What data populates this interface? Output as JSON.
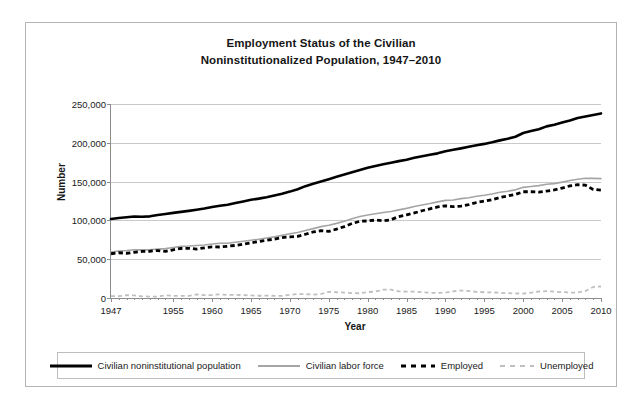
{
  "chart_data": {
    "type": "line",
    "title": "Employment Status of the Civilian Noninstitutionalized Population, 1947–2010",
    "title_line1": "Employment Status of the Civilian",
    "title_line2": "Noninstitutionalized Population, 1947–2010",
    "xlabel": "Year",
    "ylabel": "Number",
    "xlim": [
      1947,
      2010
    ],
    "ylim": [
      0,
      250000
    ],
    "grid": "horizontal",
    "legend_position": "bottom",
    "ytick_labels": [
      "0",
      "50,000",
      "100,000",
      "150,000",
      "200,000",
      "250,000"
    ],
    "ytick_values": [
      0,
      50000,
      100000,
      150000,
      200000,
      250000
    ],
    "xtick_labels": [
      "1947",
      "1955",
      "1960",
      "1965",
      "1970",
      "1975",
      "1980",
      "1985",
      "1990",
      "1995",
      "2000",
      "2005",
      "2010"
    ],
    "xtick_values": [
      1947,
      1955,
      1960,
      1965,
      1970,
      1975,
      1980,
      1985,
      1990,
      1995,
      2000,
      2005,
      2010
    ],
    "x": [
      1947,
      1948,
      1949,
      1950,
      1951,
      1952,
      1953,
      1954,
      1955,
      1956,
      1957,
      1958,
      1959,
      1960,
      1961,
      1962,
      1963,
      1964,
      1965,
      1966,
      1967,
      1968,
      1969,
      1970,
      1971,
      1972,
      1973,
      1974,
      1975,
      1976,
      1977,
      1978,
      1979,
      1980,
      1981,
      1982,
      1983,
      1984,
      1985,
      1986,
      1987,
      1988,
      1989,
      1990,
      1991,
      1992,
      1993,
      1994,
      1995,
      1996,
      1997,
      1998,
      1999,
      2000,
      2001,
      2002,
      2003,
      2004,
      2005,
      2006,
      2007,
      2008,
      2009,
      2010
    ],
    "series": [
      {
        "name": "Civilian noninstitutional population",
        "style": "solid-thick-black",
        "color": "#000000",
        "values": [
          101827,
          103068,
          103994,
          104995,
          104621,
          105231,
          107056,
          108321,
          109683,
          110954,
          112265,
          113727,
          115329,
          117245,
          118771,
          120153,
          122416,
          124485,
          126513,
          128058,
          129874,
          132028,
          134335,
          137085,
          140216,
          144126,
          147096,
          150120,
          153153,
          156150,
          159033,
          161910,
          164863,
          167745,
          170130,
          172271,
          174215,
          176383,
          178206,
          180587,
          182753,
          184613,
          186393,
          189164,
          190925,
          192805,
          194838,
          196814,
          198584,
          200591,
          203133,
          205220,
          207753,
          212577,
          215092,
          217570,
          221168,
          223357,
          226082,
          228815,
          231867,
          233788,
          235801,
          237830
        ],
        "endpoints": {
          "1947": 101827,
          "2010": 237830
        }
      },
      {
        "name": "Civilian labor force",
        "style": "solid-gray",
        "color": "#a5a5a5",
        "values": [
          59350,
          60621,
          61286,
          62208,
          62017,
          62138,
          63015,
          63643,
          65023,
          66552,
          66929,
          67639,
          68369,
          69628,
          70459,
          70614,
          71833,
          73091,
          74455,
          75770,
          77347,
          78737,
          80734,
          82771,
          84382,
          87034,
          89429,
          91949,
          93775,
          96158,
          99009,
          102251,
          104962,
          106940,
          108670,
          110204,
          111550,
          113544,
          115461,
          117834,
          119865,
          121669,
          123869,
          125840,
          126346,
          128105,
          129200,
          131056,
          132304,
          133943,
          136297,
          137673,
          139368,
          142583,
          143734,
          144863,
          146510,
          147401,
          149320,
          151428,
          153124,
          154287,
          154142,
          153889
        ],
        "endpoints": {
          "1947": 59350,
          "2010": 153889
        }
      },
      {
        "name": "Employed",
        "style": "dashed-thick-black",
        "color": "#000000",
        "values": [
          57038,
          58343,
          57651,
          58918,
          59961,
          60250,
          61179,
          60109,
          62170,
          63799,
          64071,
          63036,
          64630,
          65778,
          65746,
          66702,
          67762,
          69305,
          71088,
          72895,
          74372,
          75920,
          77902,
          78678,
          79367,
          82153,
          85064,
          86794,
          85846,
          88752,
          92017,
          96048,
          98824,
          99303,
          100397,
          99526,
          100834,
          105005,
          107150,
          109597,
          112440,
          114968,
          117342,
          118793,
          117718,
          118492,
          120259,
          123060,
          124900,
          126708,
          129558,
          131463,
          133488,
          136891,
          136933,
          136485,
          137736,
          139252,
          141730,
          144427,
          146047,
          145362,
          139877,
          139064
        ],
        "endpoints": {
          "1947": 57038,
          "2010": 139064
        }
      },
      {
        "name": "Unemployed",
        "style": "dashed-light-gray",
        "color": "#bfbfbf",
        "values": [
          2311,
          2276,
          3637,
          3288,
          2055,
          1883,
          1834,
          3532,
          2852,
          2750,
          2859,
          4602,
          3740,
          3852,
          4714,
          3911,
          4070,
          3786,
          3366,
          2875,
          2975,
          2817,
          2832,
          4093,
          5016,
          4882,
          4365,
          5156,
          7929,
          7406,
          6991,
          6202,
          6137,
          7637,
          8273,
          10678,
          10717,
          8539,
          8312,
          8237,
          7425,
          6701,
          6528,
          7047,
          8628,
          9613,
          8940,
          7996,
          7404,
          7236,
          6739,
          6210,
          5880,
          5692,
          6801,
          8378,
          8774,
          8149,
          7591,
          7001,
          7078,
          8924,
          14265,
          14825
        ],
        "endpoints": {
          "1947": 2311,
          "2010": 14825
        }
      }
    ]
  },
  "legend": {
    "items": [
      {
        "label": "Civilian noninstitutional population",
        "swatch": "solid-thick-black-swatch"
      },
      {
        "label": "Civilian labor force",
        "swatch": "solid-gray-swatch"
      },
      {
        "label": "Employed",
        "swatch": "dashed-thick-black-swatch"
      },
      {
        "label": "Unemployed",
        "swatch": "dashed-light-gray-swatch"
      }
    ]
  },
  "colors": {
    "population": "#000000",
    "labor_force": "#a5a5a5",
    "employed": "#000000",
    "unemployed": "#bfbfbf",
    "gridline": "#c9c9c9",
    "axis": "#8c8c8c",
    "border": "#b4b4b4"
  }
}
